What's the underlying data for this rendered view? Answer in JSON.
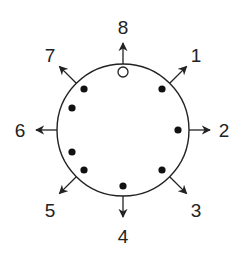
{
  "diagram": {
    "type": "radial-direction-diagram",
    "colors": {
      "stroke": "#222222",
      "background": "#ffffff",
      "dot_fill": "#111111",
      "open_dot_fill": "#ffffff"
    },
    "circle": {
      "cx": 123,
      "cy": 130,
      "r": 66
    },
    "directions": [
      {
        "label": "1",
        "angle_deg": 45,
        "label_x": 196,
        "label_y": 62
      },
      {
        "label": "2",
        "angle_deg": 90,
        "label_x": 224,
        "label_y": 137
      },
      {
        "label": "3",
        "angle_deg": 135,
        "label_x": 196,
        "label_y": 217
      },
      {
        "label": "4",
        "angle_deg": 180,
        "label_x": 123,
        "label_y": 243
      },
      {
        "label": "5",
        "angle_deg": 225,
        "label_x": 50,
        "label_y": 217
      },
      {
        "label": "6",
        "angle_deg": 270,
        "label_x": 20,
        "label_y": 137
      },
      {
        "label": "7",
        "angle_deg": 315,
        "label_x": 50,
        "label_y": 62
      },
      {
        "label": "8",
        "angle_deg": 0,
        "label_x": 123,
        "label_y": 34
      }
    ],
    "dots": [
      {
        "x": 123,
        "y": 72,
        "filled": false
      },
      {
        "x": 162,
        "y": 89,
        "filled": true
      },
      {
        "x": 178,
        "y": 130,
        "filled": true
      },
      {
        "x": 162,
        "y": 170,
        "filled": true
      },
      {
        "x": 123,
        "y": 186,
        "filled": true
      },
      {
        "x": 84,
        "y": 170,
        "filled": true
      },
      {
        "x": 72,
        "y": 152,
        "filled": true
      },
      {
        "x": 72,
        "y": 108,
        "filled": true
      },
      {
        "x": 84,
        "y": 89,
        "filled": true
      }
    ]
  }
}
